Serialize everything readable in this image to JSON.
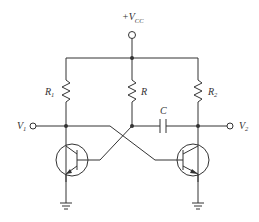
{
  "diagram": {
    "type": "circuit-schematic",
    "supply": {
      "label": "+V",
      "subscript": "CC"
    },
    "resistors": [
      {
        "label": "R",
        "subscript": "1"
      },
      {
        "label": "R",
        "subscript": ""
      },
      {
        "label": "R",
        "subscript": "2"
      }
    ],
    "capacitor": {
      "label": "C"
    },
    "outputs": [
      {
        "label": "V",
        "subscript": "1"
      },
      {
        "label": "V",
        "subscript": "2"
      }
    ],
    "transistors": [
      {
        "name": "Q-left",
        "type": "NPN"
      },
      {
        "name": "Q-right",
        "type": "NPN"
      }
    ],
    "grounds": 2,
    "colors": {
      "ink": "#333333",
      "background": "#ffffff"
    }
  }
}
